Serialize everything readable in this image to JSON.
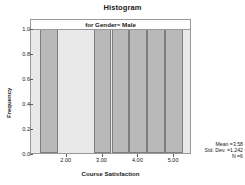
{
  "chart_data": {
    "type": "bar",
    "title": "Histogram",
    "subtitle": "for Gender= Male",
    "xlabel": "Course Satisfaction",
    "ylabel": "Frequency",
    "xlim": [
      1.0,
      5.5
    ],
    "ylim": [
      0.0,
      1.0
    ],
    "grid": false,
    "legend": "none",
    "x_ticks": [
      {
        "value": 2.0,
        "label": "2.00"
      },
      {
        "value": 3.0,
        "label": "3.00"
      },
      {
        "value": 4.0,
        "label": "4.00"
      },
      {
        "value": 5.0,
        "label": "5.00"
      }
    ],
    "y_ticks": [
      {
        "value": 0.0,
        "label": "0.0"
      },
      {
        "value": 0.2,
        "label": "0.2"
      },
      {
        "value": 0.4,
        "label": "0.4"
      },
      {
        "value": 0.6,
        "label": "0.6"
      },
      {
        "value": 0.8,
        "label": "0.8"
      },
      {
        "value": 1.0,
        "label": "1.0"
      }
    ],
    "bin_width": 0.5,
    "bins": [
      {
        "center": 1.5,
        "left": 1.25,
        "right": 1.75,
        "frequency": 1.0
      },
      {
        "center": 3.0,
        "left": 2.75,
        "right": 3.25,
        "frequency": 1.0
      },
      {
        "center": 3.5,
        "left": 3.25,
        "right": 3.75,
        "frequency": 1.0
      },
      {
        "center": 4.0,
        "left": 3.75,
        "right": 4.25,
        "frequency": 1.0
      },
      {
        "center": 4.5,
        "left": 4.25,
        "right": 4.75,
        "frequency": 1.0
      },
      {
        "center": 5.0,
        "left": 4.75,
        "right": 5.25,
        "frequency": 1.0
      }
    ],
    "categories": [
      "1.5",
      "3.0",
      "3.5",
      "4.0",
      "4.5",
      "5.0"
    ],
    "values": [
      1.0,
      1.0,
      1.0,
      1.0,
      1.0,
      1.0
    ],
    "annotations": {
      "mean": "Mean =3.58",
      "std_dev": "Std. Dev. =1.242",
      "n": "N =6"
    },
    "colors": {
      "bar_fill": "#b9b9b9",
      "bar_border": "#7e7e7e",
      "plot_background": "#e9e9e9",
      "frame_border": "#9a9a9a",
      "text": "#1a1a1a",
      "page_background": "#ffffff"
    }
  }
}
